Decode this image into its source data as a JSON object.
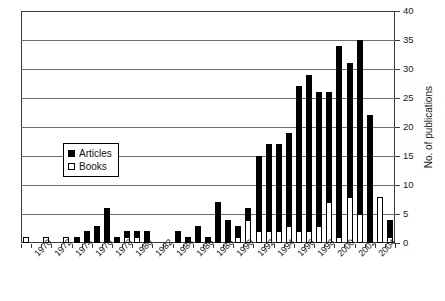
{
  "chart_data": {
    "type": "bar",
    "stacked": true,
    "title": "",
    "xlabel": "",
    "ylabel": "No. of publications",
    "ylim": [
      0,
      40
    ],
    "ytick_step": 5,
    "yticks": [
      0,
      5,
      10,
      15,
      20,
      25,
      30,
      35,
      40
    ],
    "ytick_labels": [
      "0",
      "5",
      "10",
      "15",
      "20",
      "25",
      "30",
      "35",
      "40"
    ],
    "grid": true,
    "grid_axis": "y",
    "legend_position": "center-left",
    "categories": [
      1969,
      1970,
      1971,
      1972,
      1973,
      1974,
      1975,
      1976,
      1977,
      1978,
      1979,
      1980,
      1981,
      1982,
      1983,
      1984,
      1985,
      1986,
      1987,
      1988,
      1989,
      1990,
      1991,
      1992,
      1993,
      1994,
      1995,
      1996,
      1997,
      1998,
      1999,
      2000,
      2001,
      2002,
      2003,
      2004,
      2005
    ],
    "xtick_labels": [
      "1970",
      "1972",
      "1974",
      "1976",
      "1978",
      "1980",
      "1982",
      "1984",
      "1986",
      "1988",
      "1990",
      "1992",
      "1994",
      "1996",
      "1998",
      "2000",
      "2002",
      "2004"
    ],
    "series": [
      {
        "name": "Books",
        "color": "#ffffff",
        "edge_color": "#000000",
        "values": [
          1,
          0,
          1,
          0,
          1,
          0,
          0,
          0,
          0,
          0,
          1,
          1,
          0,
          0,
          0,
          0,
          0,
          0,
          0,
          0,
          0,
          1,
          4,
          2,
          2,
          2,
          3,
          2,
          2,
          3,
          7,
          1,
          8,
          5,
          0,
          8,
          1
        ]
      },
      {
        "name": "Articles",
        "color": "#000000",
        "edge_color": "#000000",
        "values": [
          0,
          0,
          0,
          0,
          0,
          1,
          2,
          3,
          6,
          1,
          1,
          1,
          2,
          0,
          0,
          2,
          1,
          3,
          1,
          7,
          4,
          2,
          2,
          13,
          15,
          15,
          16,
          25,
          27,
          23,
          19,
          33,
          23,
          30,
          22,
          0,
          3
        ]
      }
    ],
    "totals": [
      1,
      0,
      1,
      0,
      1,
      1,
      2,
      3,
      6,
      1,
      2,
      2,
      2,
      0,
      0,
      2,
      1,
      3,
      1,
      7,
      4,
      3,
      6,
      15,
      17,
      17,
      19,
      27,
      29,
      26,
      26,
      34,
      31,
      35,
      22,
      8,
      4
    ],
    "legend_entries": [
      "Articles",
      "Books"
    ]
  }
}
